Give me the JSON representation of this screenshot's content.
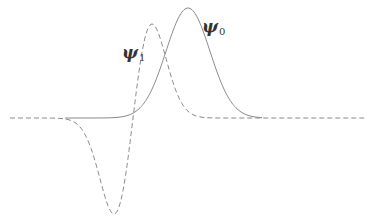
{
  "diagram": {
    "colors": {
      "line": "#8a8a8a",
      "label": "#333333",
      "background": "#ffffff"
    },
    "baseline_y": 118,
    "x_range": [
      10,
      367
    ]
  },
  "curves": [
    {
      "name": "psi0",
      "style": "solid",
      "type": "gaussian",
      "center_x": 188,
      "peak_y": 8,
      "sigma": 22,
      "x_start": 65,
      "x_end": 262
    },
    {
      "name": "psi1",
      "style": "dashed",
      "type": "odd-gaussian",
      "center_x": 133,
      "peak": {
        "x": 152,
        "y": 24
      },
      "trough": {
        "x": 114,
        "y": 214
      },
      "sigma": 19,
      "x_start": 10,
      "x_end": 367
    }
  ],
  "labels": {
    "psi0": {
      "symbol": "ψ",
      "subscript": "0",
      "x": 202,
      "y": 18
    },
    "psi1": {
      "symbol": "ψ",
      "subscript": "1",
      "x": 122,
      "y": 44
    }
  }
}
